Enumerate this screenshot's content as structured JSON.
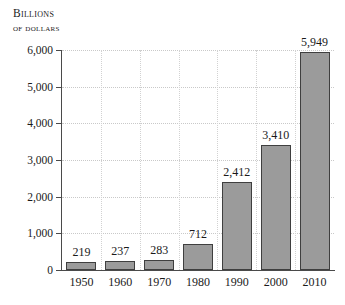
{
  "chart_data": {
    "type": "bar",
    "title": "",
    "axis_title_line1": "Billions",
    "axis_title_line2": "of dollars",
    "xlabel": "",
    "ylabel": "Billions of dollars",
    "categories": [
      "1950",
      "1960",
      "1970",
      "1980",
      "1990",
      "2000",
      "2010"
    ],
    "values": [
      219,
      237,
      283,
      712,
      2412,
      3410,
      5949
    ],
    "value_labels": [
      "219",
      "237",
      "283",
      "712",
      "2,412",
      "3,410",
      "5,949"
    ],
    "ylim": [
      0,
      6000
    ],
    "ytick_values": [
      0,
      1000,
      2000,
      3000,
      4000,
      5000,
      6000
    ],
    "ytick_labels": [
      "0",
      "1,000",
      "2,000",
      "3,000",
      "4,000",
      "5,000",
      "6,000"
    ],
    "grid": "both",
    "legend": "none",
    "bar_fill_color": "#9b9b9b",
    "bar_border_color": "#3f3f3f",
    "axis_color": "#4a4a4a",
    "gridline_color": "#c9c9c9",
    "background_color": "#ffffff"
  }
}
